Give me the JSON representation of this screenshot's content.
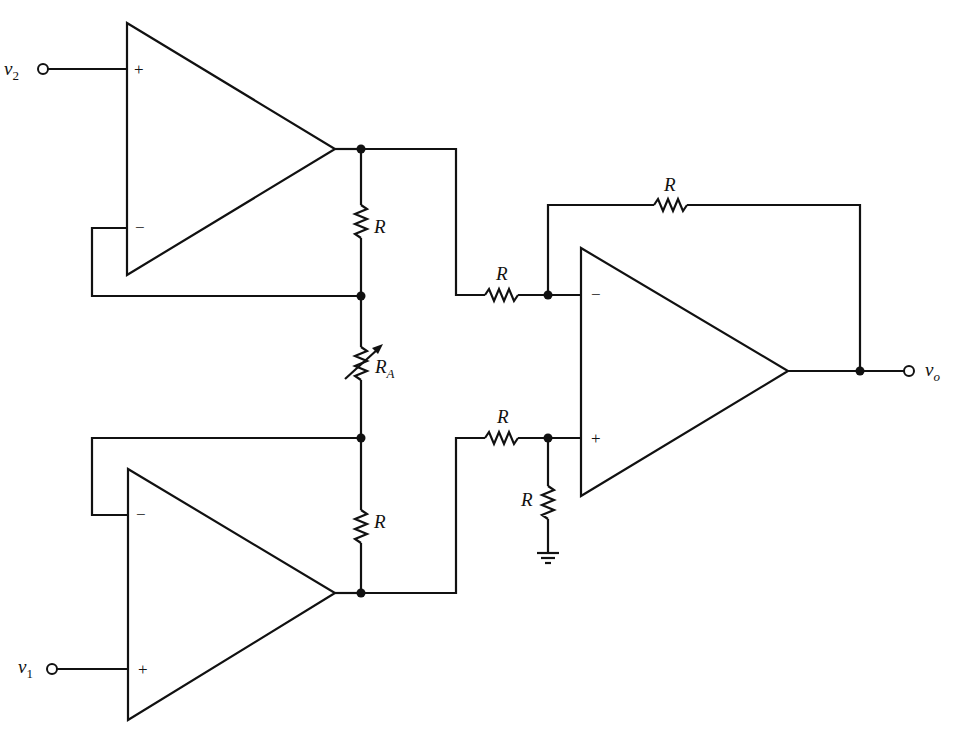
{
  "diagram": {
    "type": "circuit-schematic",
    "inputs": {
      "v2": {
        "main": "v",
        "sub": "2"
      },
      "v1": {
        "main": "v",
        "sub": "1"
      }
    },
    "output": {
      "main": "v",
      "sub": "o"
    },
    "op_amps": [
      {
        "id": "A1",
        "position": "top-left",
        "plus_label": "+",
        "minus_label": "−"
      },
      {
        "id": "A2",
        "position": "bottom-left",
        "plus_label": "+",
        "minus_label": "−"
      },
      {
        "id": "A3",
        "position": "right",
        "plus_label": "+",
        "minus_label": "−"
      }
    ],
    "resistors": {
      "r_top_feedback": "R",
      "r_gain_variable": {
        "main": "R",
        "sub": "A"
      },
      "r_bottom_feedback": "R",
      "r_input_minus": "R",
      "r_input_plus": "R",
      "r_ground": "R",
      "r_output_feedback": "R"
    },
    "ground_symbol": "ground"
  }
}
